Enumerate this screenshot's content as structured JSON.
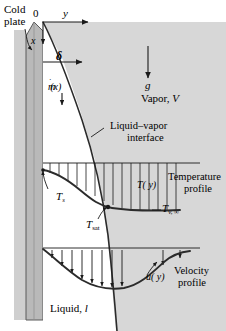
{
  "figure": {
    "kind": "engineering-schematic",
    "title_visible": false,
    "colors": {
      "vapor_background": "#d7d7d7",
      "plate_fill": "#b9b9b9",
      "plate_edge": "#555555",
      "liquid_film_fill": "#ffffff",
      "line": "#1a1a1a",
      "curve_thick": "#2b2b2b",
      "text": "#000000"
    }
  },
  "labels": {
    "cold_plate_line1": "Cold",
    "cold_plate_line2": "plate",
    "origin": "0",
    "axis_y": "y",
    "axis_x": "x",
    "film_thickness": "δ",
    "mass_flow": "ṁ(x)",
    "mass_flow_base": "m",
    "mass_flow_arg": "(x)",
    "gravity": "g",
    "vapor_region": "Vapor, V",
    "vapor_region_word": "Vapor,",
    "vapor_region_symbol": "V",
    "interface_line1": "Liquid–vapor",
    "interface_line2": "interface",
    "temp_wall": "T",
    "temp_wall_sub": "s",
    "temp_sat": "T",
    "temp_sat_sub": "sat",
    "temp_vapor_inf": "T",
    "temp_vapor_inf_sub": "v, ∞",
    "temp_function": "T",
    "temp_function_arg": "( y)",
    "temp_profile_line1": "Temperature",
    "temp_profile_line2": "profile",
    "velocity_function": "u",
    "velocity_function_arg": "( y)",
    "velocity_profile_line1": "Velocity",
    "velocity_profile_line2": "profile",
    "liquid_region_word": "Liquid,",
    "liquid_region_symbol": "l"
  },
  "geometry": {
    "canvas_width": 226,
    "canvas_height": 331,
    "origin_point": [
      43,
      22
    ],
    "vapor_rect": [
      43,
      22,
      183,
      309
    ],
    "plate_rect": [
      26,
      30,
      17,
      290
    ],
    "delta_arrow": [
      43,
      62,
      87,
      62
    ],
    "gravity_arrow": [
      148,
      48,
      148,
      80
    ],
    "temp_axis_y": 163,
    "velocity_axis_y": 243
  },
  "curve_points": {
    "interface": [
      [
        43,
        22
      ],
      [
        63,
        60
      ],
      [
        80,
        110
      ],
      [
        95,
        160
      ],
      [
        104,
        210
      ],
      [
        110,
        260
      ],
      [
        114,
        310
      ],
      [
        116,
        331
      ]
    ],
    "temperature_profile": [
      [
        43,
        170
      ],
      [
        60,
        175
      ],
      [
        78,
        186
      ],
      [
        96,
        199
      ],
      [
        112,
        206
      ],
      [
        132,
        209
      ],
      [
        152,
        210
      ],
      [
        175,
        210
      ]
    ],
    "velocity_profile": [
      [
        43,
        248
      ],
      [
        58,
        258
      ],
      [
        74,
        270
      ],
      [
        92,
        281
      ],
      [
        110,
        287
      ],
      [
        128,
        287
      ],
      [
        143,
        281
      ],
      [
        156,
        268
      ],
      [
        168,
        258
      ],
      [
        180,
        255
      ]
    ]
  },
  "temperature_hatch_x": [
    50,
    59,
    68,
    77,
    86,
    95,
    104,
    113,
    122,
    131,
    140,
    149,
    158,
    167,
    176
  ],
  "velocity_arrows": [
    {
      "x": 52,
      "y_top": 250,
      "y_bottom": 261
    },
    {
      "x": 62,
      "y_top": 250,
      "y_bottom": 269
    },
    {
      "x": 72,
      "y_top": 250,
      "y_bottom": 276
    },
    {
      "x": 82,
      "y_top": 250,
      "y_bottom": 282
    },
    {
      "x": 92,
      "y_top": 250,
      "y_bottom": 287
    },
    {
      "x": 102,
      "y_top": 250,
      "y_bottom": 290
    },
    {
      "x": 112,
      "y_top": 250,
      "y_bottom": 291
    },
    {
      "x": 122,
      "y_top": 250,
      "y_bottom": 290
    },
    {
      "x": 163,
      "y_top": 250,
      "y_bottom": 268
    },
    {
      "x": 180,
      "y_top": 250,
      "y_bottom": 261
    }
  ]
}
